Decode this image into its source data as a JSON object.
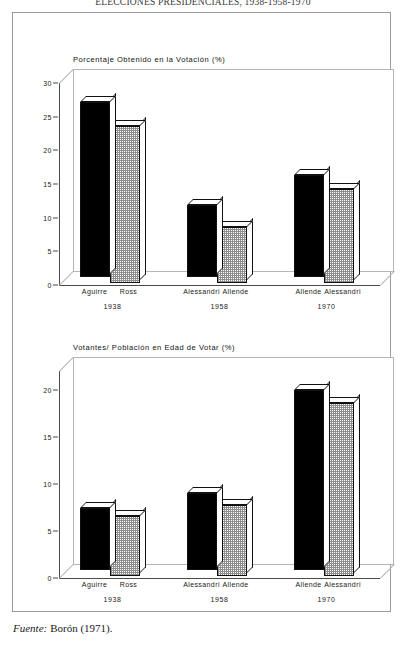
{
  "running_head": "ELECCIONES PRESIDENCIALES, 1938-1958-1970",
  "source": {
    "label": "Fuente:",
    "text": "Borón (1971)."
  },
  "chart_data": [
    {
      "type": "bar",
      "title": "Porcentaje Obtenido en la Votación (%)",
      "xlabel": "",
      "ylabel": "",
      "ylim": [
        0,
        30
      ],
      "yticks": [
        0,
        5,
        10,
        15,
        20,
        25,
        30
      ],
      "grid": false,
      "legend": "none",
      "groups": [
        {
          "year": "1938",
          "candidates": [
            "Aguirre",
            "Ross"
          ],
          "values": [
            28.0,
            25.1
          ]
        },
        {
          "year": "1958",
          "candidates": [
            "Alessandri",
            "Allende"
          ],
          "values": [
            11.5,
            9.0
          ]
        },
        {
          "year": "1970",
          "candidates": [
            "Allende",
            "Alessandri"
          ],
          "values": [
            16.3,
            15.0
          ]
        }
      ],
      "categories": [
        "Aguirre",
        "Ross",
        "Alessandri",
        "Allende",
        "Allende",
        "Alessandri"
      ],
      "values": [
        28.0,
        25.1,
        11.5,
        9.0,
        16.3,
        15.0
      ]
    },
    {
      "type": "bar",
      "title": "Votantes/ Población en Edad de Votar (%)",
      "xlabel": "",
      "ylabel": "",
      "ylim": [
        0,
        22
      ],
      "yticks": [
        0,
        5,
        10,
        15,
        20
      ],
      "grid": false,
      "legend": "none",
      "groups": [
        {
          "year": "1938",
          "candidates": [
            "Aguirre",
            "Ross"
          ],
          "values": [
            7.1,
            6.8
          ]
        },
        {
          "year": "1958",
          "candidates": [
            "Alessandri",
            "Allende"
          ],
          "values": [
            8.8,
            8.1
          ]
        },
        {
          "year": "1970",
          "candidates": [
            "Allende",
            "Alessandri"
          ],
          "values": [
            20.5,
            19.7
          ]
        }
      ],
      "categories": [
        "Aguirre",
        "Ross",
        "Alessandri",
        "Allende",
        "Allende",
        "Alessandri"
      ],
      "values": [
        7.1,
        6.8,
        8.8,
        8.1,
        20.5,
        19.7
      ]
    }
  ]
}
